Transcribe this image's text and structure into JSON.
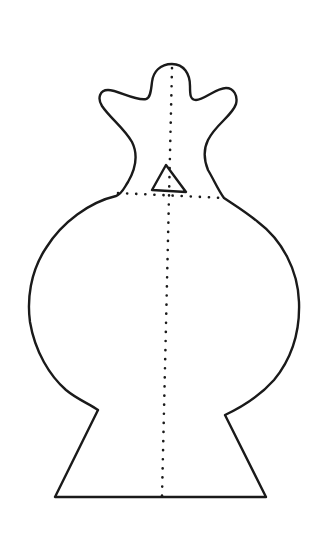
{
  "figure": {
    "stroke_color": "#1a1a1a",
    "background": "#ffffff",
    "outline_path": "M 172 64 C 160 64 153 72 152 82 C 151 92 150 98 146 99 C 135 101 118 90 108 90 C 100 90 97 98 102 106 C 110 118 124 128 132 142 C 138 154 136 168 128 182 C 124 188 122 194 116 196 C 90 202 62 222 46 248 C 30 272 27 300 30 322 C 35 352 50 376 66 390 C 78 400 90 404 98 410 L 55 497 L 266 497 L 225 415 C 240 408 258 398 274 380 C 292 358 300 330 299 302 C 298 270 282 240 258 222 C 246 212 236 206 224 198 C 218 190 214 180 208 170 C 204 160 203 150 208 140 C 216 124 232 116 236 104 C 238 96 234 88 226 88 C 216 88 204 100 196 100 C 190 100 190 94 190 86 C 190 74 184 64 172 64 Z",
    "triangle_path": "M 166 165 L 152 190 L 186 192 Z",
    "vertical_dotted_line": {
      "x1": 172,
      "y1": 68,
      "x2": 162,
      "y2": 496
    },
    "horizontal_dotted_line": {
      "x1": 118,
      "y1": 193,
      "x2": 224,
      "y2": 198
    }
  }
}
